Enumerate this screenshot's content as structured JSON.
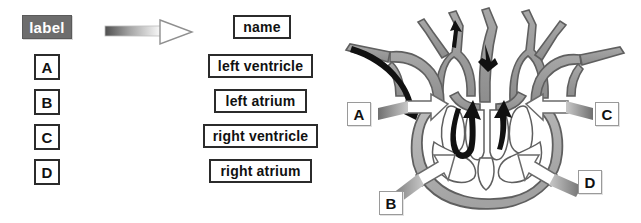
{
  "diagram": {
    "title_visible": false,
    "kind": "heart-anatomy-labeling-exercise"
  },
  "label_column": {
    "header": "label",
    "items": [
      {
        "id": "A",
        "text": "A"
      },
      {
        "id": "B",
        "text": "B"
      },
      {
        "id": "C",
        "text": "C"
      },
      {
        "id": "D",
        "text": "D"
      }
    ]
  },
  "transform": {
    "icon": "right-arrow-icon"
  },
  "name_column": {
    "header": "name",
    "items": [
      {
        "id": "name-1",
        "text": "left ventricle"
      },
      {
        "id": "name-2",
        "text": "left atrium"
      },
      {
        "id": "name-3",
        "text": "right ventricle"
      },
      {
        "id": "name-4",
        "text": "right atrium"
      }
    ]
  },
  "heart_diagram": {
    "callouts": [
      {
        "id": "A",
        "text": "A",
        "position": "left-upper"
      },
      {
        "id": "B",
        "text": "B",
        "position": "bottom-left"
      },
      {
        "id": "C",
        "text": "C",
        "position": "right-upper"
      },
      {
        "id": "D",
        "text": "D",
        "position": "bottom-right"
      }
    ]
  },
  "colors": {
    "label_header_fill": "#6d6d6d",
    "label_header_text": "#ffffff",
    "box_border": "#2b2b2b",
    "box_fill": "#ffffff",
    "box_text": "#111111",
    "vessel_gray": "#9b9b9b",
    "chamber_fill": "#b5b5b5",
    "outline_dark": "#4a4a4a",
    "flow_arrow_dark": "#111111",
    "callout_arrow_dark": "#5a5a5a",
    "background": "#ffffff"
  }
}
